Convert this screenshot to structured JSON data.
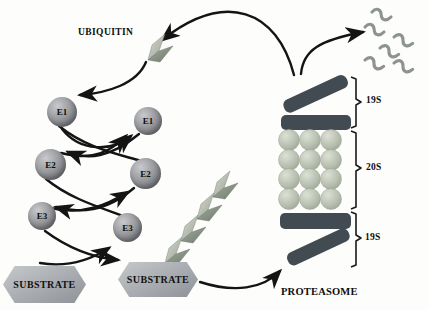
{
  "diagram": {
    "labels": {
      "ubiquitin": "UBIQUITIN",
      "proteasome": "PROTEASOME"
    },
    "enzymes": [
      {
        "id": "e1-left",
        "label": "E1"
      },
      {
        "id": "e1-right",
        "label": "E1"
      },
      {
        "id": "e2-left",
        "label": "E2"
      },
      {
        "id": "e2-right",
        "label": "E2"
      },
      {
        "id": "e3-left",
        "label": "E3"
      },
      {
        "id": "e3-right",
        "label": "E3"
      }
    ],
    "substrates": [
      {
        "id": "substrate-free",
        "label": "SUBSTRATE"
      },
      {
        "id": "substrate-ubiquitinated",
        "label": "SUBSTRATE"
      }
    ],
    "proteasome_sections": [
      {
        "id": "cap-top",
        "label": "19S"
      },
      {
        "id": "core",
        "label": "20S"
      },
      {
        "id": "cap-bottom",
        "label": "19S"
      }
    ],
    "icons": {
      "ubiquitin_icon": "ubiquitin-chevron",
      "polyubiquitin_chain": "stacked-ubiquitin-chevrons",
      "peptides": "degraded-peptide-squiggles"
    },
    "colors": {
      "background": "#fdfdfc",
      "arrow": "#141414",
      "enzyme_sphere": "#96979b",
      "cap_19s": "#434b52",
      "core_20s_sphere": "#b7bfb0",
      "substrate": "#a7aaae",
      "ubiquitin_light": "#c8cdc3",
      "ubiquitin_dark": "#7e887b",
      "peptide": "#8d938d"
    }
  }
}
